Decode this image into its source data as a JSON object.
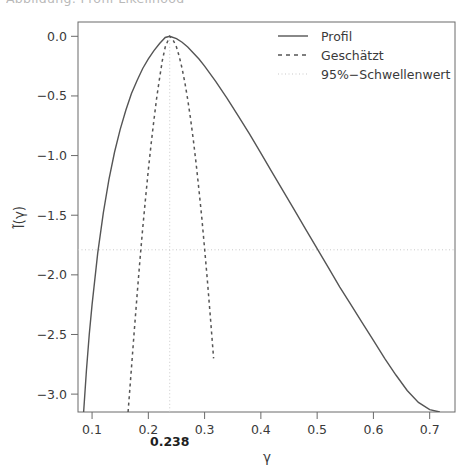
{
  "header": {
    "clipped_caption": "Abbildung: Profil-Likelihood"
  },
  "chart_data": {
    "type": "line",
    "title": "",
    "xlabel": "γ",
    "ylabel": "l̃(γ)",
    "xlim": [
      0.075,
      0.745
    ],
    "ylim": [
      -3.15,
      0.12
    ],
    "grid": false,
    "xticks": [
      0.1,
      0.2,
      0.3,
      0.4,
      0.5,
      0.6,
      0.7
    ],
    "xtick_labels": [
      "0.1",
      "0.2",
      "0.3",
      "0.4",
      "0.5",
      "0.6",
      "0.7"
    ],
    "yticks": [
      0.0,
      -0.5,
      -1.0,
      -1.5,
      -2.0,
      -2.5,
      -3.0
    ],
    "ytick_labels": [
      "0.0",
      "−0.5",
      "−1.0",
      "−1.5",
      "−2.0",
      "−2.5",
      "−3.0"
    ],
    "annotations": [
      {
        "name": "mle-estimate",
        "text": "0.238",
        "x": 0.238,
        "axis": "x-below",
        "bold": true
      }
    ],
    "threshold": {
      "label": "95%−Schwellenwert",
      "value": -1.79,
      "style": "dotted",
      "color": "#c9c9c9"
    },
    "vertical_marker": {
      "name": "mle-vertical-line",
      "x": 0.238,
      "style": "dotted",
      "color": "#c9c9c9"
    },
    "legend": {
      "position": "top-right",
      "entries": [
        {
          "label": "Profil",
          "style": "solid",
          "color": "#555555"
        },
        {
          "label": "Geschätzt",
          "style": "dashed",
          "color": "#555555"
        },
        {
          "label": "95%−Schwellenwert",
          "style": "dotted",
          "color": "#c9c9c9"
        }
      ]
    },
    "series": [
      {
        "name": "Profil",
        "style": "solid",
        "color": "#555555",
        "x": [
          0.085,
          0.09,
          0.095,
          0.1,
          0.11,
          0.12,
          0.13,
          0.14,
          0.15,
          0.16,
          0.17,
          0.18,
          0.19,
          0.2,
          0.21,
          0.22,
          0.23,
          0.238,
          0.25,
          0.26,
          0.27,
          0.28,
          0.29,
          0.3,
          0.32,
          0.34,
          0.36,
          0.38,
          0.4,
          0.42,
          0.44,
          0.46,
          0.48,
          0.5,
          0.52,
          0.54,
          0.56,
          0.58,
          0.6,
          0.62,
          0.64,
          0.66,
          0.68,
          0.7,
          0.718
        ],
        "y": [
          -3.15,
          -2.8,
          -2.5,
          -2.25,
          -1.82,
          -1.48,
          -1.2,
          -0.97,
          -0.78,
          -0.62,
          -0.48,
          -0.37,
          -0.27,
          -0.19,
          -0.12,
          -0.06,
          -0.01,
          0.0,
          -0.02,
          -0.05,
          -0.09,
          -0.14,
          -0.19,
          -0.25,
          -0.38,
          -0.52,
          -0.67,
          -0.82,
          -0.98,
          -1.14,
          -1.3,
          -1.46,
          -1.62,
          -1.78,
          -1.94,
          -2.1,
          -2.25,
          -2.4,
          -2.55,
          -2.7,
          -2.84,
          -2.97,
          -3.07,
          -3.13,
          -3.15
        ]
      },
      {
        "name": "Geschätzt",
        "style": "dashed",
        "color": "#555555",
        "x": [
          0.164,
          0.17,
          0.175,
          0.18,
          0.185,
          0.19,
          0.195,
          0.2,
          0.205,
          0.21,
          0.215,
          0.22,
          0.225,
          0.23,
          0.238,
          0.245,
          0.25,
          0.255,
          0.26,
          0.265,
          0.27,
          0.275,
          0.28,
          0.285,
          0.29,
          0.295,
          0.3,
          0.305,
          0.31,
          0.316
        ],
        "y": [
          -3.15,
          -2.78,
          -2.47,
          -2.17,
          -1.88,
          -1.61,
          -1.36,
          -1.12,
          -0.9,
          -0.7,
          -0.51,
          -0.35,
          -0.2,
          -0.09,
          0.0,
          -0.04,
          -0.09,
          -0.17,
          -0.27,
          -0.39,
          -0.53,
          -0.69,
          -0.87,
          -1.07,
          -1.29,
          -1.52,
          -1.78,
          -2.05,
          -2.34,
          -2.7
        ]
      }
    ]
  }
}
